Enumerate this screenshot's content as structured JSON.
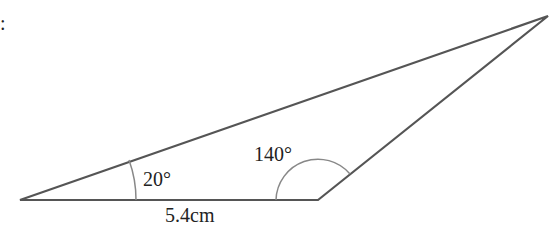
{
  "diagram": {
    "type": "triangle",
    "vertices": {
      "left": [
        20,
        200
      ],
      "bottom_right": [
        318,
        200
      ],
      "top": [
        548,
        16
      ]
    },
    "angles": [
      {
        "label": "20°",
        "value": 20,
        "vertex": "left"
      },
      {
        "label": "140°",
        "value": 140,
        "vertex": "bottom_right"
      }
    ],
    "sides": [
      {
        "label": "5.4cm",
        "value": 5.4,
        "unit": "cm",
        "between": [
          "left",
          "bottom_right"
        ]
      }
    ],
    "line_color": "#555555",
    "arc_color": "#888888"
  },
  "labels": {
    "angle_left": "20°",
    "angle_right": "140°",
    "base_length": "5.4cm",
    "corner_mark": ":"
  }
}
